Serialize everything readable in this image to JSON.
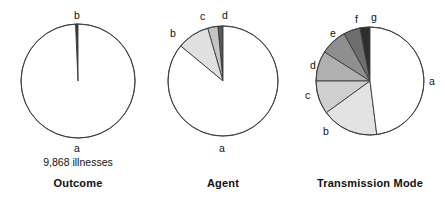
{
  "figure": {
    "background": "#ffffff",
    "outline_color": "#3a3a3a"
  },
  "panels": [
    {
      "id": "outcome",
      "title": "Outcome",
      "total_label": "9,868 illnesses",
      "center_x": 78,
      "center_y": 81,
      "radius": 57,
      "slices": [
        {
          "label": "a",
          "value": 99.3,
          "color": "#ffffff",
          "label_x": 74,
          "label_y": 143
        },
        {
          "label": "b",
          "value": 0.7,
          "color": "#3a3a3a",
          "label_x": 74,
          "label_y": 10
        }
      ]
    },
    {
      "id": "agent",
      "title": "Agent",
      "total_label": "",
      "center_x": 223,
      "center_y": 81,
      "radius": 55,
      "slices": [
        {
          "label": "a",
          "value": 86.0,
          "color": "#ffffff",
          "label_x": 219,
          "label_y": 143
        },
        {
          "label": "b",
          "value": 9.5,
          "color": "#e0e0e0",
          "label_x": 170,
          "label_y": 28
        },
        {
          "label": "c",
          "value": 3.0,
          "color": "#c4c4c4",
          "label_x": 200,
          "label_y": 11
        },
        {
          "label": "d",
          "value": 1.5,
          "color": "#585858",
          "label_x": 222,
          "label_y": 10
        }
      ]
    },
    {
      "id": "transmission-mode",
      "title": "Transmission Mode",
      "total_label": "",
      "center_x": 370,
      "center_y": 81,
      "radius": 54,
      "slices": [
        {
          "label": "a",
          "value": 48.0,
          "color": "#ffffff",
          "label_x": 429,
          "label_y": 76
        },
        {
          "label": "b",
          "value": 17.0,
          "color": "#e3e3e3",
          "label_x": 323,
          "label_y": 126
        },
        {
          "label": "c",
          "value": 10.0,
          "color": "#cfcfcf",
          "label_x": 305,
          "label_y": 90
        },
        {
          "label": "d",
          "value": 9.0,
          "color": "#b0b0b0",
          "label_x": 310,
          "label_y": 60
        },
        {
          "label": "e",
          "value": 8.0,
          "color": "#8f8f8f",
          "label_x": 330,
          "label_y": 28
        },
        {
          "label": "f",
          "value": 5.0,
          "color": "#6e6e6e",
          "label_x": 355,
          "label_y": 14
        },
        {
          "label": "g",
          "value": 3.0,
          "color": "#2e2e2e",
          "label_x": 371,
          "label_y": 12
        }
      ]
    }
  ],
  "chart_data": {
    "type": "pie",
    "title": "",
    "subtitle": "",
    "legend_position": "inline-labels",
    "charts": [
      {
        "title": "Outcome",
        "annotation": "9,868 illnesses",
        "categories": [
          "a",
          "b"
        ],
        "values": [
          99.3,
          0.7
        ],
        "colors": [
          "#ffffff",
          "#3a3a3a"
        ],
        "start_angle_deg": 0,
        "direction": "counterclockwise"
      },
      {
        "title": "Agent",
        "annotation": "",
        "categories": [
          "a",
          "b",
          "c",
          "d"
        ],
        "values": [
          86.0,
          9.5,
          3.0,
          1.5
        ],
        "colors": [
          "#ffffff",
          "#e0e0e0",
          "#c4c4c4",
          "#585858"
        ],
        "start_angle_deg": 0,
        "direction": "counterclockwise"
      },
      {
        "title": "Transmission Mode",
        "annotation": "",
        "categories": [
          "a",
          "b",
          "c",
          "d",
          "e",
          "f",
          "g"
        ],
        "values": [
          48.0,
          17.0,
          10.0,
          9.0,
          8.0,
          5.0,
          3.0
        ],
        "colors": [
          "#ffffff",
          "#e3e3e3",
          "#cfcfcf",
          "#b0b0b0",
          "#8f8f8f",
          "#6e6e6e",
          "#2e2e2e"
        ],
        "start_angle_deg": 0,
        "direction": "counterclockwise"
      }
    ]
  }
}
